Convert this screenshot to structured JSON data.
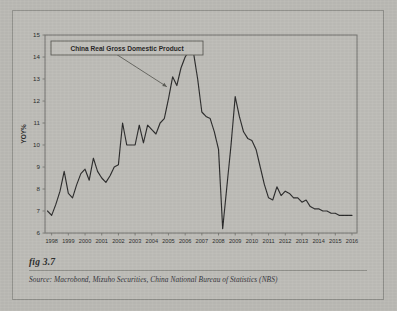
{
  "figure": {
    "number_label": "fig 3.7",
    "source_prefix": "Source:",
    "source_text": "Macrobond, Mizuho Securities, China National Bureau of Statistics (NBS)",
    "source_full": "Source:  Macrobond, Mizuho Securities, China National Bureau of Statistics (NBS)"
  },
  "annotation": {
    "title_box_label": "China Real Gross Domestic Product",
    "arrow_name": "pointer-arrow"
  },
  "colors": {
    "page_background": "#b9b8b3",
    "plot_background": "#bcbbb6",
    "line": "#2a2a2a",
    "axis": "#6f6f6a",
    "text": "#2b2b2b",
    "border": "#8d8d88"
  },
  "chart_data": {
    "type": "line",
    "title": "China Real Gross Domestic Product",
    "xlabel": "",
    "ylabel": "YOY%",
    "ylim": [
      6,
      15
    ],
    "xlim": [
      1997.6,
      2016.3
    ],
    "yticks": [
      6,
      7,
      8,
      9,
      10,
      11,
      12,
      13,
      14,
      15
    ],
    "ytick_labels": [
      "6",
      "7",
      "8",
      "9",
      "10",
      "11",
      "12",
      "13",
      "14",
      "15"
    ],
    "xticks": [
      1998,
      1999,
      2000,
      2001,
      2002,
      2003,
      2004,
      2005,
      2006,
      2007,
      2008,
      2009,
      2010,
      2011,
      2012,
      2013,
      2014,
      2015,
      2016
    ],
    "xtick_labels": [
      "1998",
      "1999",
      "2000",
      "2001",
      "2002",
      "2003",
      "2004",
      "2005",
      "2006",
      "2007",
      "2008",
      "2009",
      "2010",
      "2011",
      "2012",
      "2013",
      "2014",
      "2015",
      "2016"
    ],
    "grid": false,
    "legend": false,
    "series": [
      {
        "name": "China Real GDP, YOY%",
        "x": [
          1997.75,
          1998.0,
          1998.25,
          1998.5,
          1998.75,
          1999.0,
          1999.25,
          1999.5,
          1999.75,
          2000.0,
          2000.25,
          2000.5,
          2000.75,
          2001.0,
          2001.25,
          2001.5,
          2001.75,
          2002.0,
          2002.25,
          2002.5,
          2002.75,
          2003.0,
          2003.25,
          2003.5,
          2003.75,
          2004.0,
          2004.25,
          2004.5,
          2004.75,
          2005.0,
          2005.25,
          2005.5,
          2005.75,
          2006.0,
          2006.25,
          2006.5,
          2006.75,
          2007.0,
          2007.25,
          2007.5,
          2007.75,
          2008.0,
          2008.25,
          2008.5,
          2008.75,
          2009.0,
          2009.25,
          2009.5,
          2009.75,
          2010.0,
          2010.25,
          2010.5,
          2010.75,
          2011.0,
          2011.25,
          2011.5,
          2011.75,
          2012.0,
          2012.25,
          2012.5,
          2012.75,
          2013.0,
          2013.25,
          2013.5,
          2013.75,
          2014.0,
          2014.25,
          2014.5,
          2014.75,
          2015.0,
          2015.25,
          2015.5,
          2015.75,
          2016.0
        ],
        "values": [
          7.0,
          6.8,
          7.3,
          7.9,
          8.8,
          7.8,
          7.6,
          8.2,
          8.7,
          8.9,
          8.4,
          9.4,
          8.8,
          8.5,
          8.3,
          8.6,
          9.0,
          9.1,
          11.0,
          10.0,
          10.0,
          10.0,
          10.9,
          10.1,
          10.9,
          10.7,
          10.5,
          11.0,
          11.2,
          12.1,
          13.1,
          12.7,
          13.5,
          14.0,
          14.3,
          14.2,
          13.0,
          11.5,
          11.3,
          11.2,
          10.6,
          9.8,
          6.2,
          8.1,
          10.0,
          12.2,
          11.3,
          10.6,
          10.3,
          10.2,
          9.8,
          9.0,
          8.2,
          7.6,
          7.5,
          8.1,
          7.7,
          7.9,
          7.8,
          7.6,
          7.6,
          7.4,
          7.5,
          7.2,
          7.1,
          7.1,
          7.0,
          7.0,
          6.9,
          6.9,
          6.8,
          6.8,
          6.8,
          6.8
        ]
      }
    ],
    "annotations": [
      {
        "text": "China Real Gross Domestic Product",
        "type": "boxed-label-with-arrow",
        "arrow_from": [
          2001.0,
          14.55
        ],
        "arrow_to": [
          2004.9,
          12.65
        ]
      }
    ],
    "notable_points": {
      "peak_value": 14.3,
      "peak_year": "2006-2007",
      "trough_value": 6.2,
      "trough_year": "2008-2009",
      "recovery_peak_value": 12.2,
      "recovery_peak_year": "2009-2010",
      "end_value": 6.8,
      "end_year": "2016"
    }
  }
}
